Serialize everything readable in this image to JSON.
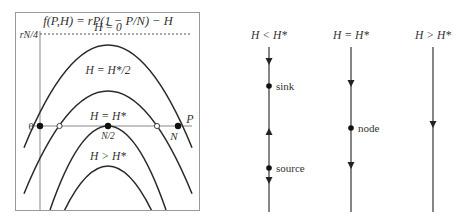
{
  "left_panel": {
    "title": "f(P,H) = rP(1 − P/N) − H",
    "y_tick": "rN/4",
    "x_axis_label": "P",
    "origin_label": "0",
    "x_ticks": {
      "mid": "N/2",
      "end": "N"
    },
    "curves": [
      {
        "label": "H = 0"
      },
      {
        "label": "H = H*/2"
      },
      {
        "label": "H = H*"
      },
      {
        "label": "H > H*"
      }
    ]
  },
  "phase_lines": [
    {
      "header": "H < H*",
      "points": [
        {
          "label": "sink"
        },
        {
          "label": "source"
        }
      ]
    },
    {
      "header": "H = H*",
      "points": [
        {
          "label": "node"
        }
      ]
    },
    {
      "header": "H > H*",
      "points": []
    }
  ],
  "colors": {
    "line": "#333333",
    "axis": "#888888",
    "frame": "#999999",
    "background": "#ffffff"
  }
}
